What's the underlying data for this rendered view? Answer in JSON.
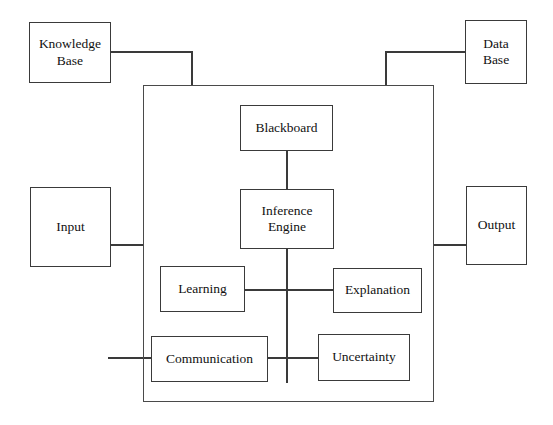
{
  "diagram": {
    "type": "block-diagram",
    "canvas": {
      "width": 553,
      "height": 425
    },
    "style": {
      "background_color": "#ffffff",
      "line_color": "#3a3a3a",
      "text_color": "#111111",
      "frame_color": "#4a4a4a"
    },
    "frame": {
      "name": "expert-system-boundary",
      "x": 143,
      "y": 85,
      "width": 291,
      "height": 317
    },
    "nodes": [
      {
        "id": "knowledge-base",
        "label": "Knowledge\nBase",
        "x": 29,
        "y": 22,
        "width": 82,
        "height": 61,
        "region": "external-top-left"
      },
      {
        "id": "data-base",
        "label": "Data\nBase",
        "x": 465,
        "y": 20,
        "width": 62,
        "height": 64,
        "region": "external-top-right"
      },
      {
        "id": "input",
        "label": "Input",
        "x": 30,
        "y": 187,
        "width": 81,
        "height": 80,
        "region": "external-left"
      },
      {
        "id": "output",
        "label": "Output",
        "x": 466,
        "y": 186,
        "width": 61,
        "height": 79,
        "region": "external-right"
      },
      {
        "id": "blackboard",
        "label": "Blackboard",
        "x": 240,
        "y": 105,
        "width": 93,
        "height": 46,
        "region": "internal"
      },
      {
        "id": "inference-engine",
        "label": "Inference\nEngine",
        "x": 240,
        "y": 189,
        "width": 94,
        "height": 60,
        "region": "internal"
      },
      {
        "id": "learning",
        "label": "Learning",
        "x": 160,
        "y": 266,
        "width": 85,
        "height": 46,
        "region": "internal"
      },
      {
        "id": "explanation",
        "label": "Explanation",
        "x": 333,
        "y": 268,
        "width": 89,
        "height": 45,
        "region": "internal"
      },
      {
        "id": "communication",
        "label": "Communication",
        "x": 151,
        "y": 336,
        "width": 117,
        "height": 46,
        "region": "internal"
      },
      {
        "id": "uncertainty",
        "label": "Uncertainty",
        "x": 318,
        "y": 334,
        "width": 92,
        "height": 47,
        "region": "internal"
      }
    ],
    "connections": [
      {
        "id": "knowledge-base-to-frame",
        "from": "knowledge-base",
        "to": "expert-system-boundary",
        "path": "M 111 52 L 192 52 L 192 85"
      },
      {
        "id": "data-base-to-frame",
        "from": "data-base",
        "to": "expert-system-boundary",
        "path": "M 465 52 L 386 52 L 386 85"
      },
      {
        "id": "input-to-frame",
        "from": "input",
        "to": "expert-system-boundary",
        "path": "M 111 245 L 143 245"
      },
      {
        "id": "frame-to-output",
        "from": "expert-system-boundary",
        "to": "output",
        "path": "M 434 245 L 466 245"
      },
      {
        "id": "blackboard-to-inference-engine",
        "from": "blackboard",
        "to": "inference-engine",
        "path": "M 287 151 L 287 189"
      },
      {
        "id": "inference-engine-bus",
        "from": "inference-engine",
        "to": "communication-bus",
        "path": "M 287 249 L 287 383"
      },
      {
        "id": "learning-to-explanation",
        "from": "learning",
        "to": "explanation",
        "path": "M 245 290 L 333 290"
      },
      {
        "id": "communication-to-uncertainty",
        "from": "communication",
        "to": "uncertainty",
        "path": "M 268 358 L 318 358"
      },
      {
        "id": "communication-external-link",
        "from": "communication",
        "to": "external-left-edge",
        "path": "M 151 358 L 108 358"
      }
    ]
  }
}
